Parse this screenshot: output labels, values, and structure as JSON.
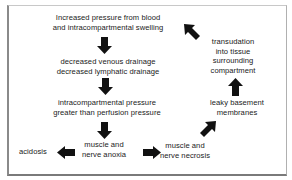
{
  "diagram": {
    "title": "",
    "nodes": {
      "increased_pressure": {
        "lines": [
          "Increased pressure from blood",
          "and intracompartmental swelling"
        ]
      },
      "decreased_drainage": {
        "lines": [
          "decreased venous drainage",
          "decreased lymphatic drainage"
        ]
      },
      "intracompartmental_pressure": {
        "lines": [
          "intracompartmental pressure",
          "greater than perfusion pressure"
        ]
      },
      "anoxia": {
        "lines": [
          "muscle and",
          "nerve anoxia"
        ]
      },
      "acidosis": {
        "lines": [
          "acidosis"
        ]
      },
      "necrosis": {
        "lines": [
          "muscle and",
          "nerve necrosis"
        ]
      },
      "leaky_membranes": {
        "lines": [
          "leaky basement",
          "membranes"
        ]
      },
      "transudation": {
        "lines": [
          "transudation",
          "into tissue",
          "surrounding",
          "compartment"
        ]
      }
    },
    "edges": [
      {
        "from": "increased_pressure",
        "to": "decreased_drainage",
        "direction": "down"
      },
      {
        "from": "decreased_drainage",
        "to": "intracompartmental_pressure",
        "direction": "down"
      },
      {
        "from": "intracompartmental_pressure",
        "to": "anoxia",
        "direction": "down"
      },
      {
        "from": "anoxia",
        "to": "acidosis",
        "direction": "left"
      },
      {
        "from": "anoxia",
        "to": "necrosis",
        "direction": "right"
      },
      {
        "from": "necrosis",
        "to": "leaky_membranes",
        "direction": "up-right"
      },
      {
        "from": "leaky_membranes",
        "to": "transudation",
        "direction": "up"
      },
      {
        "from": "transudation",
        "to": "increased_pressure",
        "direction": "up-left"
      }
    ],
    "colors": {
      "arrow": "#111111",
      "text": "#1a1a1a",
      "frame": "#8a8a8a",
      "background": "#ffffff"
    }
  }
}
